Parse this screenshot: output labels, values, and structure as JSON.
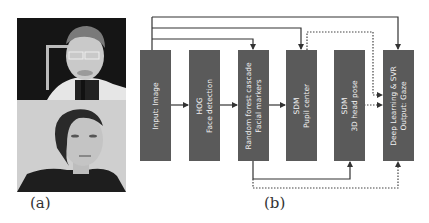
{
  "figure": {
    "panel_a": {
      "label": "(a)",
      "photos": [
        {
          "description": "man with glasses in chin rest, dark background"
        },
        {
          "description": "woman face, light background"
        }
      ]
    },
    "panel_b": {
      "label": "(b)",
      "boxes": [
        {
          "id": "input",
          "lines": [
            "Input: Image"
          ]
        },
        {
          "id": "hog",
          "lines": [
            "HOG",
            "Face detection"
          ]
        },
        {
          "id": "rf",
          "lines": [
            "Random forest cascade",
            "Facial markers"
          ]
        },
        {
          "id": "sdm_pupil",
          "lines": [
            "SDM",
            "Pupil center"
          ]
        },
        {
          "id": "sdm_head",
          "lines": [
            "SDM",
            "3D head pose"
          ]
        },
        {
          "id": "dl",
          "lines": [
            "Deep Learning & SVR",
            "Output: Gaze"
          ]
        }
      ],
      "colors": {
        "box": "#5a5a5a",
        "box_text": "#f2f2f2",
        "line": "#333333"
      }
    }
  }
}
